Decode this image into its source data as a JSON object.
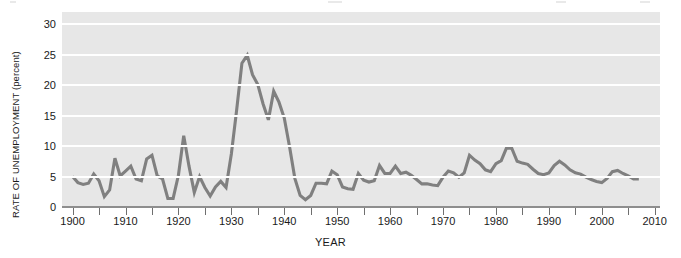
{
  "chart_data": {
    "type": "line",
    "title": "",
    "xlabel": "YEAR",
    "ylabel": "RATE OF UNEMPLOYMENT (percent)",
    "xlim": [
      1898,
      2011
    ],
    "ylim": [
      0,
      32
    ],
    "yticks": [
      0,
      5,
      10,
      15,
      20,
      25,
      30
    ],
    "ytick_labels": [
      "0",
      "5",
      "10",
      "15",
      "20",
      "25",
      "30"
    ],
    "xticks": [
      1900,
      1905,
      1910,
      1915,
      1920,
      1925,
      1930,
      1935,
      1940,
      1945,
      1950,
      1955,
      1960,
      1965,
      1970,
      1975,
      1980,
      1985,
      1990,
      1995,
      2000,
      2005,
      2010
    ],
    "xtick_labels_major": [
      "1900",
      "1910",
      "1920",
      "1930",
      "1940",
      "1950",
      "1960",
      "1970",
      "1980",
      "1990",
      "2000",
      "2010"
    ],
    "xticks_major": [
      1900,
      1910,
      1920,
      1930,
      1940,
      1950,
      1960,
      1970,
      1980,
      1990,
      2000,
      2010
    ],
    "grid": "horizontal-white",
    "legend": "none",
    "line_color": "#808080",
    "plot_background": "#e7e7e7",
    "x": [
      1900,
      1901,
      1902,
      1903,
      1904,
      1905,
      1906,
      1907,
      1908,
      1909,
      1910,
      1911,
      1912,
      1913,
      1914,
      1915,
      1916,
      1917,
      1918,
      1919,
      1920,
      1921,
      1922,
      1923,
      1924,
      1925,
      1926,
      1927,
      1928,
      1929,
      1930,
      1931,
      1932,
      1933,
      1934,
      1935,
      1936,
      1937,
      1938,
      1939,
      1940,
      1941,
      1942,
      1943,
      1944,
      1945,
      1946,
      1947,
      1948,
      1949,
      1950,
      1951,
      1952,
      1953,
      1954,
      1955,
      1956,
      1957,
      1958,
      1959,
      1960,
      1961,
      1962,
      1963,
      1964,
      1965,
      1966,
      1967,
      1968,
      1969,
      1970,
      1971,
      1972,
      1973,
      1974,
      1975,
      1976,
      1977,
      1978,
      1979,
      1980,
      1981,
      1982,
      1983,
      1984,
      1985,
      1986,
      1987,
      1988,
      1989,
      1990,
      1991,
      1992,
      1993,
      1994,
      1995,
      1996,
      1997,
      1998,
      1999,
      2000,
      2001,
      2002,
      2003,
      2004,
      2005,
      2006,
      2007
    ],
    "values": [
      5.0,
      4.0,
      3.7,
      3.9,
      5.4,
      4.3,
      1.7,
      2.8,
      8.0,
      5.1,
      5.9,
      6.7,
      4.6,
      4.3,
      7.9,
      8.5,
      5.1,
      4.6,
      1.4,
      1.4,
      5.2,
      11.7,
      6.7,
      2.4,
      5.0,
      3.2,
      1.8,
      3.3,
      4.2,
      3.2,
      8.7,
      15.9,
      23.6,
      24.9,
      21.7,
      20.1,
      16.9,
      14.3,
      19.0,
      17.2,
      14.6,
      9.9,
      4.7,
      1.9,
      1.2,
      1.9,
      3.9,
      3.9,
      3.8,
      5.9,
      5.3,
      3.3,
      3.0,
      2.9,
      5.5,
      4.4,
      4.1,
      4.3,
      6.8,
      5.5,
      5.5,
      6.7,
      5.5,
      5.7,
      5.2,
      4.5,
      3.8,
      3.8,
      3.6,
      3.5,
      4.9,
      5.9,
      5.6,
      4.9,
      5.6,
      8.5,
      7.7,
      7.1,
      6.1,
      5.8,
      7.1,
      7.6,
      9.7,
      9.6,
      7.5,
      7.2,
      7.0,
      6.2,
      5.5,
      5.3,
      5.6,
      6.8,
      7.5,
      6.9,
      6.1,
      5.6,
      5.4,
      4.9,
      4.5,
      4.2,
      4.0,
      4.7,
      5.8,
      6.0,
      5.5,
      5.1,
      4.6,
      4.6
    ]
  }
}
